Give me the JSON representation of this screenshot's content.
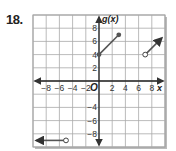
{
  "problem": {
    "number": "18."
  },
  "chart_data": {
    "type": "line",
    "title": "",
    "xlabel": "x",
    "ylabel": "g(x)",
    "origin_label": "O",
    "xlim": [
      -10,
      10
    ],
    "ylim": [
      -10,
      10
    ],
    "grid": true,
    "grid_step": 2,
    "x_tick_labels": [
      "-8",
      "-6",
      "-4",
      "-2",
      "2",
      "4",
      "6",
      "8"
    ],
    "y_tick_labels": [
      "8",
      "6",
      "4",
      "2",
      "-4",
      "-6",
      "-8"
    ],
    "series": [
      {
        "name": "segment-1",
        "points": [
          [
            0,
            4
          ],
          [
            3,
            7
          ]
        ],
        "start": "closed",
        "end": "closed"
      },
      {
        "name": "ray-right",
        "points": [
          [
            7,
            4
          ],
          [
            9.5,
            6.5
          ]
        ],
        "start": "open",
        "end": "arrow"
      },
      {
        "name": "ray-left",
        "points": [
          [
            -5,
            -9
          ],
          [
            -9.5,
            -9
          ]
        ],
        "start": "open",
        "end": "arrow"
      }
    ],
    "colors": {
      "line": "#555555",
      "grid": "#aaaaaa",
      "axis": "#222222"
    }
  }
}
